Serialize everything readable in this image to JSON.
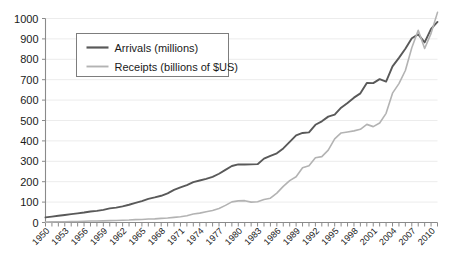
{
  "chart_data": {
    "type": "line",
    "title": "",
    "xlabel": "",
    "ylabel": "",
    "grid": true,
    "legend_position": "top-left",
    "xlim": [
      1950,
      2011
    ],
    "ylim": [
      0,
      1000
    ],
    "ytick_step": 100,
    "ytick_labels": [
      "0",
      "100",
      "200",
      "300",
      "400",
      "500",
      "600",
      "700",
      "800",
      "900",
      "1000"
    ],
    "xtick_labels": [
      "1950",
      "1953",
      "1956",
      "1959",
      "1962",
      "1965",
      "1968",
      "1971",
      "1974",
      "1977",
      "1980",
      "1983",
      "1986",
      "1989",
      "1992",
      "1995",
      "1998",
      "2001",
      "2004",
      "2007",
      "2010"
    ],
    "xtick_label_step": 3,
    "x": [
      1950,
      1951,
      1952,
      1953,
      1954,
      1955,
      1956,
      1957,
      1958,
      1959,
      1960,
      1961,
      1962,
      1963,
      1964,
      1965,
      1966,
      1967,
      1968,
      1969,
      1970,
      1971,
      1972,
      1973,
      1974,
      1975,
      1976,
      1977,
      1978,
      1979,
      1980,
      1981,
      1982,
      1983,
      1984,
      1985,
      1986,
      1987,
      1988,
      1989,
      1990,
      1991,
      1992,
      1993,
      1994,
      1995,
      1996,
      1997,
      1998,
      1999,
      2000,
      2001,
      2002,
      2003,
      2004,
      2005,
      2006,
      2007,
      2008,
      2009,
      2010,
      2011
    ],
    "series": [
      {
        "name": "Arrivals (millions)",
        "color": "#595959",
        "width": 1.9,
        "values": [
          25,
          29,
          33,
          37,
          41,
          45,
          49,
          54,
          57,
          62,
          69,
          73,
          79,
          87,
          96,
          105,
          116,
          123,
          131,
          143,
          160,
          172,
          183,
          198,
          206,
          214,
          224,
          239,
          258,
          277,
          285,
          284,
          285,
          286,
          313,
          327,
          339,
          363,
          395,
          427,
          439,
          442,
          479,
          496,
          519,
          529,
          563,
          586,
          612,
          633,
          684,
          683,
          703,
          691,
          765,
          807,
          852,
          903,
          922,
          883,
          949,
          983
        ]
      },
      {
        "name": "Receipts (billions of $US)",
        "color": "#b3b3b3",
        "width": 1.6,
        "values": [
          2,
          3,
          4,
          4,
          5,
          5,
          6,
          7,
          7,
          8,
          9,
          10,
          11,
          12,
          14,
          15,
          17,
          18,
          20,
          22,
          25,
          28,
          33,
          42,
          46,
          53,
          59,
          69,
          84,
          101,
          106,
          107,
          100,
          102,
          113,
          119,
          144,
          177,
          205,
          224,
          268,
          278,
          317,
          323,
          355,
          410,
          439,
          444,
          449,
          457,
          481,
          470,
          488,
          535,
          634,
          681,
          745,
          857,
          942,
          853,
          927,
          1030
        ]
      }
    ]
  },
  "legend": {
    "entries": [
      {
        "label": "Arrivals (millions)"
      },
      {
        "label": "Receipts (billions of $US)"
      }
    ]
  }
}
